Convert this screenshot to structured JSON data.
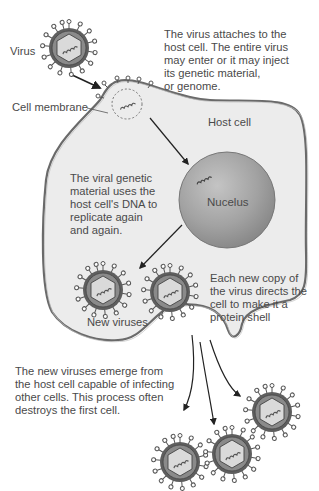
{
  "diagram": {
    "labels": {
      "virus": "Virus",
      "cell_membrane": "Cell membrane",
      "host_cell": "Host cell",
      "nucleus": "Nucelus",
      "new_viruses": "New viruses"
    },
    "captions": {
      "attach": "The virus attaches to the\nhost cell. The entire virus\nmay enter or it may inject\nits genetic material,\nor genome.",
      "replicate": "The viral genetic\nmaterial uses the\nhost cell's DNA to\nreplicate again\nand again.",
      "protein_shell": "Each new copy of\nthe virus directs the\ncell to make it a\nprotein shell",
      "emerge": "The new viruses emerge from\nthe host cell capable of infecting\nother cells. This process often\ndestroys the first cell."
    },
    "colors": {
      "cell_fill": "#ececec",
      "membrane": "#6a6a6a",
      "nucleus": "#9a9a9a",
      "capsid_outer": "#5e5e5e",
      "capsid_ring": "#8a8a8a",
      "hexagon": "#d9d9d9",
      "arrow": "#222222"
    },
    "steps": [
      {
        "step": 1,
        "name": "attachment"
      },
      {
        "step": 2,
        "name": "replication"
      },
      {
        "step": 3,
        "name": "assembly"
      },
      {
        "step": 4,
        "name": "release"
      }
    ]
  }
}
